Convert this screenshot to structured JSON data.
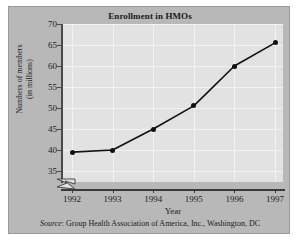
{
  "figure": {
    "title": "Enrollment in HMOs",
    "source_word": "Source",
    "source_text": ": Group Health Association of America, Inc., Washington, DC",
    "background_color": "#b8b8b8",
    "plot_background_color": "#e2e2e2",
    "line_color": "#111111"
  },
  "chart_data": {
    "type": "line",
    "title": "Enrollment in HMOs",
    "xlabel": "Year",
    "ylabel": "Numbers of members (in millions)",
    "ylabel_line1": "Numbers of members",
    "ylabel_line2": "(in millions)",
    "categories": [
      "1992",
      "1993",
      "1994",
      "1995",
      "1996",
      "1997"
    ],
    "x": [
      1992,
      1993,
      1994,
      1995,
      1996,
      1997
    ],
    "values": [
      39.5,
      40,
      45,
      50.5,
      60,
      65.5
    ],
    "series": [
      {
        "name": "Enrollment in HMOs",
        "values": [
          39.5,
          40,
          45,
          50.5,
          60,
          65.5
        ]
      }
    ],
    "ylim": [
      35,
      70
    ],
    "yticks": [
      35,
      40,
      45,
      50,
      55,
      60,
      65,
      70
    ],
    "ytick_labels": [
      "35",
      "40",
      "45",
      "50",
      "55",
      "60",
      "65",
      "70"
    ],
    "xticks": [
      1992,
      1993,
      1994,
      1995,
      1996,
      1997
    ],
    "xtick_labels": [
      "1992",
      "1993",
      "1994",
      "1995",
      "1996",
      "1997"
    ],
    "grid": true,
    "legend": null,
    "y_axis_break": true,
    "marker": "filled-circle",
    "units": "millions of members"
  }
}
